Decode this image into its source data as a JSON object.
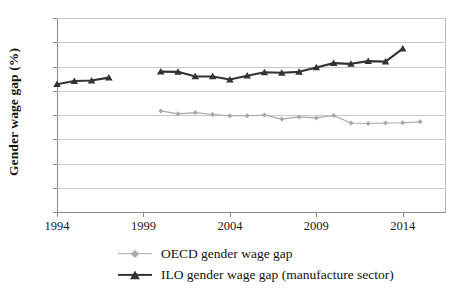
{
  "chart_data": {
    "type": "line",
    "title": "",
    "xlabel": "",
    "ylabel": "Gender wage gap (%)",
    "ylim": [
      0,
      80
    ],
    "xlim": [
      1994,
      2016.5
    ],
    "ytick_values": [
      0,
      10,
      20,
      30,
      40,
      50,
      60,
      70,
      80
    ],
    "ytick_labels": [
      "0",
      "10",
      "20",
      "30",
      "40",
      "50",
      "60",
      "70",
      "80"
    ],
    "xtick_values": [
      1994,
      1999,
      2004,
      2009,
      2014
    ],
    "xtick_labels": [
      "1994",
      "1999",
      "2004",
      "2009",
      "2014"
    ],
    "grid": "horizontal",
    "legend_position": "bottom",
    "series": [
      {
        "name": "OECD gender wage gap",
        "color": "#a8a8a8",
        "marker": "diamond",
        "x": [
          2000,
          2001,
          2002,
          2003,
          2004,
          2005,
          2006,
          2007,
          2008,
          2009,
          2010,
          2011,
          2012,
          2013,
          2014,
          2015
        ],
        "values": [
          41.7,
          40.5,
          41.0,
          40.2,
          39.7,
          39.7,
          40.0,
          38.3,
          39.2,
          38.8,
          39.8,
          36.7,
          36.5,
          36.7,
          36.8,
          37.2
        ]
      },
      {
        "name": "ILO gender wage gap (manufacture sector)",
        "color": "#333333",
        "marker": "triangle",
        "segments": [
          {
            "x": [
              1994,
              1995,
              1996,
              1997
            ],
            "values": [
              52.7,
              54.0,
              54.2,
              55.4
            ]
          },
          {
            "x": [
              2000,
              2001,
              2002,
              2003,
              2004,
              2005,
              2006,
              2007,
              2008,
              2009,
              2010,
              2011,
              2012,
              2013,
              2014
            ],
            "values": [
              57.9,
              57.8,
              55.9,
              55.9,
              54.6,
              56.2,
              57.6,
              57.4,
              57.8,
              59.6,
              61.4,
              61.1,
              62.2,
              62.0,
              67.4
            ]
          }
        ]
      }
    ]
  },
  "legend": {
    "items": [
      {
        "label": "OECD gender wage gap"
      },
      {
        "label": "ILO gender wage gap (manufacture sector)"
      }
    ]
  },
  "axis": {
    "y_title": "Gender wage gap (%)"
  }
}
